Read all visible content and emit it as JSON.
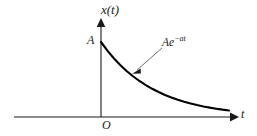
{
  "figure": {
    "background_color": "#ffffff",
    "line_color": "#000000",
    "width": 257,
    "height": 136
  },
  "labels": {
    "y_axis": "x(t)",
    "x_axis": "t",
    "origin": "O",
    "amplitude": "A",
    "curve_base": "Ae",
    "curve_exponent": "−at"
  },
  "chart_data": {
    "type": "line",
    "title": "",
    "xlabel": "t",
    "ylabel": "x(t)",
    "grid": false,
    "legend": null,
    "annotations": [
      {
        "text": "Ae^{-at}",
        "points_to_x": 0.3,
        "points_to_y": 0.45
      },
      {
        "text": "A",
        "note": "y-intercept amplitude"
      },
      {
        "text": "O",
        "note": "origin"
      }
    ],
    "axis_origin_label": "O",
    "xlim": [
      0,
      1
    ],
    "ylim": [
      0,
      1
    ],
    "series": [
      {
        "name": "Ae^{-at}",
        "x": [
          0.0,
          0.05,
          0.1,
          0.15,
          0.2,
          0.25,
          0.3,
          0.35,
          0.4,
          0.45,
          0.5,
          0.55,
          0.6,
          0.65,
          0.7,
          0.75,
          0.8,
          0.85,
          0.9,
          0.95,
          1.0
        ],
        "y": [
          1.0,
          0.885,
          0.783,
          0.693,
          0.613,
          0.543,
          0.48,
          0.425,
          0.376,
          0.333,
          0.294,
          0.261,
          0.231,
          0.204,
          0.181,
          0.16,
          0.141,
          0.125,
          0.111,
          0.098,
          0.087
        ]
      }
    ]
  },
  "geometry": {
    "x_axis_start_x": 14,
    "x_axis_end_x": 232,
    "x_axis_y": 117,
    "y_axis_x": 101,
    "y_axis_top_y": 22,
    "curve_start_y": 42,
    "curve_end_x": 229
  }
}
